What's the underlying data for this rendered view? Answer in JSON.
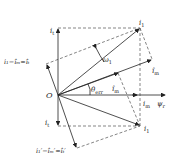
{
  "diagram": {
    "type": "phasor-vector-diagram",
    "origin_label": "O",
    "labels": {
      "i_t": "i",
      "i_t_sub": "t",
      "i_1": "i",
      "i_1_sub": "1",
      "i_m_hat": "î",
      "i_m_hat_sub": "m",
      "omega": "ω",
      "omega_sub": "1",
      "theta": "θ",
      "theta_sub": "err",
      "i_m_prime": "î",
      "i_m_prime_sub": "m",
      "i_m_axis": "i",
      "i_m_axis_sub": "m",
      "psi_r": "ψ",
      "psi_r_sub": "r",
      "i_t_prime": "i",
      "i_t_prime_sub": "t",
      "i_1_prime": "i",
      "i_1_prime_sub": "1",
      "upper_eq": "i₁−îₘ=îₜ",
      "lower_eq": "i₁′−îₘ′=îₜ′"
    }
  }
}
